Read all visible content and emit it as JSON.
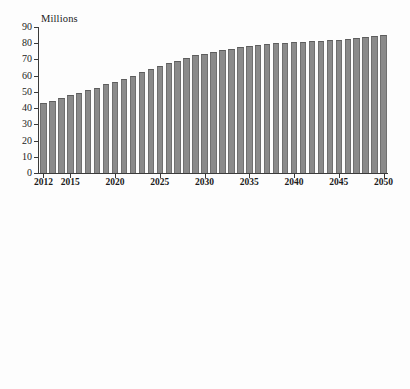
{
  "chart_data": [
    {
      "id": "population-millions",
      "type": "bar",
      "title": "Millions",
      "xlabel": "",
      "ylabel": "Millions",
      "ylim": [
        0,
        90
      ],
      "yticks": [
        0,
        10,
        20,
        30,
        40,
        50,
        60,
        70,
        80,
        90
      ],
      "ytick_labels": [
        "0",
        "10",
        "20",
        "30",
        "40",
        "50",
        "60",
        "70",
        "80",
        "90"
      ],
      "xticks": [
        2012,
        2015,
        2020,
        2025,
        2030,
        2035,
        2040,
        2045,
        2050
      ],
      "xtick_labels": [
        "2012",
        "2015",
        "2020",
        "2025",
        "2030",
        "2035",
        "2040",
        "2045",
        "2050"
      ],
      "grid": false,
      "legend": "none",
      "bar_color": "#8a8a8a",
      "categories": [
        2012,
        2013,
        2014,
        2015,
        2016,
        2017,
        2018,
        2019,
        2020,
        2021,
        2022,
        2023,
        2024,
        2025,
        2026,
        2027,
        2028,
        2029,
        2030,
        2031,
        2032,
        2033,
        2034,
        2035,
        2036,
        2037,
        2038,
        2039,
        2040,
        2041,
        2042,
        2043,
        2044,
        2045,
        2046,
        2047,
        2048,
        2049,
        2050
      ],
      "values": [
        43.1,
        44.7,
        46.2,
        47.8,
        49.2,
        51.4,
        52.7,
        54.8,
        56.4,
        58.2,
        60.0,
        62.0,
        63.9,
        65.8,
        67.6,
        69.0,
        71.0,
        72.6,
        73.6,
        74.9,
        75.6,
        76.7,
        77.5,
        78.4,
        79.2,
        79.8,
        80.0,
        80.4,
        80.8,
        81.0,
        81.4,
        81.6,
        81.8,
        82.3,
        82.8,
        83.3,
        83.9,
        84.5,
        85.3
      ]
    },
    {
      "id": "population-percent",
      "type": "bar",
      "title": "Percent of total population",
      "xlabel": "",
      "ylabel": "Percent of total population",
      "ylim": [
        0,
        25
      ],
      "yticks": [
        0,
        5,
        10,
        15,
        20,
        25
      ],
      "ytick_labels": [
        "0",
        "5",
        "10",
        "15",
        "20",
        "25"
      ],
      "xticks": [
        2012,
        2015,
        2020,
        2025,
        2030,
        2035,
        2040,
        2045,
        2050
      ],
      "xtick_labels": [
        "2012",
        "2015",
        "2020",
        "2025",
        "2030",
        "2035",
        "2040",
        "2045",
        "2050"
      ],
      "grid": false,
      "legend": "none",
      "bar_color": "#4a4a4a",
      "categories": [
        2012,
        2013,
        2014,
        2015,
        2016,
        2017,
        2018,
        2019,
        2020,
        2021,
        2022,
        2023,
        2024,
        2025,
        2026,
        2027,
        2028,
        2029,
        2030,
        2031,
        2032,
        2033,
        2034,
        2035,
        2036,
        2037,
        2038,
        2039,
        2040,
        2041,
        2042,
        2043,
        2044,
        2045,
        2046,
        2047,
        2048,
        2049,
        2050
      ],
      "values": [
        13.9,
        14.3,
        14.8,
        15.1,
        15.5,
        16.0,
        16.4,
        16.8,
        17.3,
        17.7,
        18.1,
        18.5,
        18.9,
        19.4,
        19.7,
        20.1,
        20.4,
        20.8,
        20.9,
        21.1,
        21.2,
        21.3,
        21.4,
        21.6,
        21.7,
        21.9,
        21.6,
        21.6,
        21.6,
        21.6,
        21.6,
        21.6,
        21.7,
        21.7,
        21.7,
        21.7,
        21.7,
        21.7,
        21.8
      ]
    }
  ]
}
